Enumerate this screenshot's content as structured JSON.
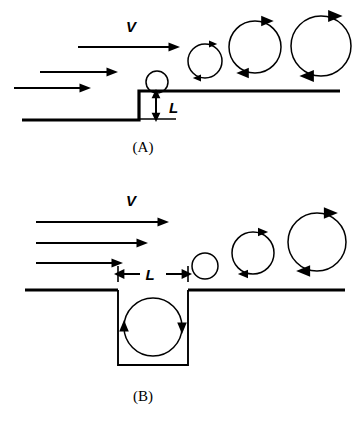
{
  "figure": {
    "background_color": "#ffffff",
    "ink_color": "#000000",
    "panels": [
      {
        "id": "A",
        "caption": "(A)",
        "caption_x": 143,
        "caption_y": 152,
        "geometry_name": "backward-facing-step",
        "velocity_label": "V",
        "velocity_label_x": 131,
        "velocity_label_y": 32,
        "length_label": "L",
        "length_label_x": 169,
        "length_label_y": 113,
        "surface": {
          "lower_y": 120,
          "upper_y": 91,
          "step_x": 139,
          "left_start_x": 22,
          "right_end_x": 340,
          "step_height_px": 29
        },
        "dimension_arrow": {
          "orientation": "vertical",
          "x": 156,
          "y_top": 92,
          "y_bottom": 119,
          "tick_x_start": 140,
          "tick_x_end": 176,
          "tick_y": 119
        },
        "flow_arrows": [
          {
            "x_start": 78,
            "x_end": 177,
            "y": 47
          },
          {
            "x_start": 40,
            "x_end": 115,
            "y": 72
          },
          {
            "x_start": 14,
            "x_end": 88,
            "y": 88
          }
        ],
        "seed_circle": {
          "cx": 157,
          "cy": 82,
          "r": 11,
          "has_arrows": false
        },
        "vortices": [
          {
            "cx": 205,
            "cy": 61,
            "r": 17,
            "rotation": "clockwise"
          },
          {
            "cx": 255,
            "cy": 47,
            "r": 26,
            "rotation": "clockwise"
          },
          {
            "cx": 321,
            "cy": 46,
            "r": 30,
            "rotation": "clockwise"
          }
        ]
      },
      {
        "id": "B",
        "caption": "(B)",
        "caption_x": 143,
        "caption_y": 401,
        "geometry_name": "cavity",
        "velocity_label": "V",
        "velocity_label_x": 131,
        "velocity_label_y": 206,
        "length_label": "L",
        "length_label_x": 150,
        "length_label_y": 280,
        "surface": {
          "surface_y": 290,
          "left_start_x": 25,
          "right_end_x": 345,
          "cavity_left_x": 118,
          "cavity_right_x": 188,
          "cavity_bottom_y": 365,
          "cavity_width_px": 70,
          "cavity_depth_px": 75
        },
        "dimension_arrow": {
          "orientation": "horizontal",
          "y": 274,
          "x_left": 118,
          "x_right": 188,
          "tick_top_y": 266,
          "tick_bottom_y": 282
        },
        "flow_arrows": [
          {
            "x_start": 36,
            "x_end": 166,
            "y": 222
          },
          {
            "x_start": 36,
            "x_end": 145,
            "y": 243
          },
          {
            "x_start": 36,
            "x_end": 120,
            "y": 263
          }
        ],
        "cavity_vortex": {
          "cx": 153,
          "cy": 327,
          "r": 29,
          "rotation": "clockwise"
        },
        "seed_circle": {
          "cx": 205,
          "cy": 266,
          "r": 13,
          "has_arrows": false
        },
        "vortices": [
          {
            "cx": 253,
            "cy": 253,
            "r": 21,
            "rotation": "clockwise"
          },
          {
            "cx": 317,
            "cy": 242,
            "r": 29,
            "rotation": "clockwise"
          }
        ]
      }
    ]
  }
}
